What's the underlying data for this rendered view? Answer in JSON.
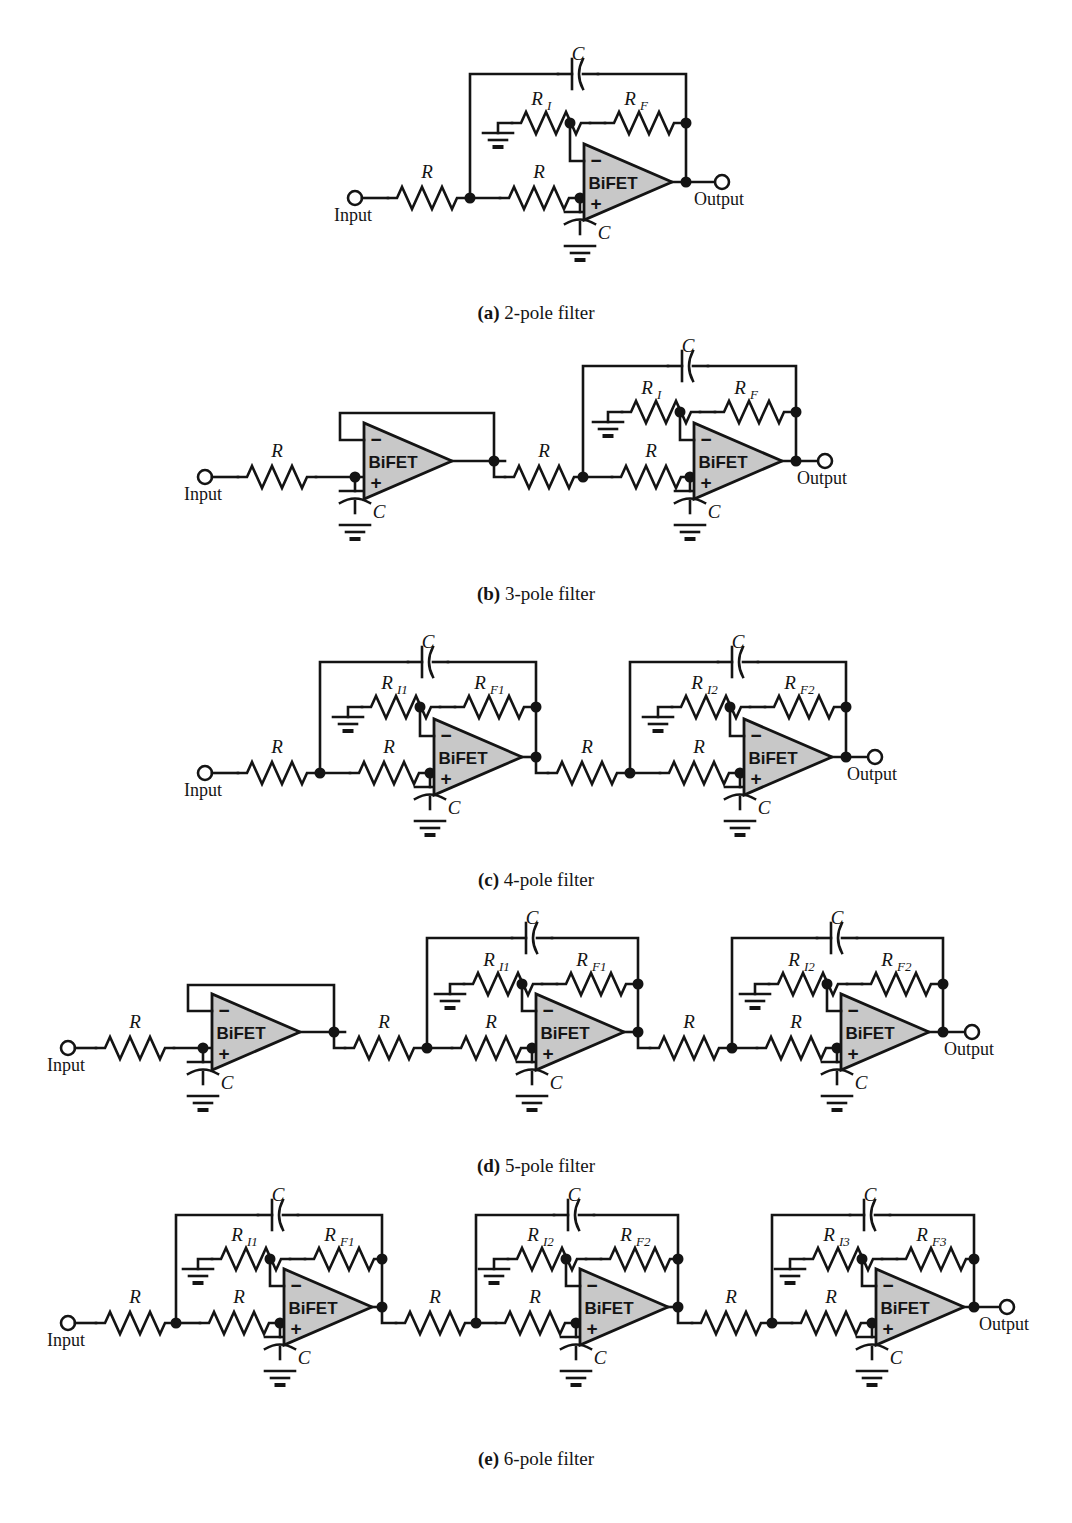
{
  "figure": {
    "title_hidden": "",
    "labels": {
      "input": "Input",
      "output": "Output",
      "amp": "BiFET",
      "minus": "−",
      "plus": "+",
      "R": "R",
      "C": "C",
      "RI": "R",
      "RI_sub": "I",
      "RF": "R",
      "RF_sub": "F",
      "RI1_sub": "I1",
      "RF1_sub": "F1",
      "RI2_sub": "I2",
      "RF2_sub": "F2",
      "RI3_sub": "I3",
      "RF3_sub": "F3"
    },
    "colors": {
      "wire": "#141414",
      "amp_fill": "#c8c8c8",
      "background": "#ffffff",
      "terminal_fill": "#ffffff"
    },
    "rows": [
      {
        "id": "a",
        "tag": "(a)",
        "caption": "2-pole filter",
        "poles": 2,
        "stages": [
          "sallen-key-2pole"
        ],
        "components": [
          "R",
          "R",
          "C",
          "C",
          "R_I",
          "R_F"
        ]
      },
      {
        "id": "b",
        "tag": "(b)",
        "caption": "3-pole filter",
        "poles": 3,
        "stages": [
          "single-pole-follower",
          "sallen-key-2pole"
        ],
        "components": [
          "R",
          "C",
          "R",
          "R",
          "C",
          "C",
          "R_I",
          "R_F"
        ]
      },
      {
        "id": "c",
        "tag": "(c)",
        "caption": "4-pole filter",
        "poles": 4,
        "stages": [
          "sallen-key-2pole",
          "sallen-key-2pole"
        ],
        "components": [
          "R",
          "R",
          "C",
          "C",
          "R_I1",
          "R_F1",
          "R",
          "R",
          "C",
          "C",
          "R_I2",
          "R_F2"
        ]
      },
      {
        "id": "d",
        "tag": "(d)",
        "caption": "5-pole filter",
        "poles": 5,
        "stages": [
          "single-pole-follower",
          "sallen-key-2pole",
          "sallen-key-2pole"
        ],
        "components": [
          "R",
          "C",
          "R",
          "R",
          "C",
          "C",
          "R_I1",
          "R_F1",
          "R",
          "R",
          "C",
          "C",
          "R_I2",
          "R_F2"
        ]
      },
      {
        "id": "e",
        "tag": "(e)",
        "caption": "6-pole filter",
        "poles": 6,
        "stages": [
          "sallen-key-2pole",
          "sallen-key-2pole",
          "sallen-key-2pole"
        ],
        "components": [
          "R",
          "R",
          "C",
          "C",
          "R_I1",
          "R_F1",
          "R",
          "R",
          "C",
          "C",
          "R_I2",
          "R_F2",
          "R",
          "R",
          "C",
          "C",
          "R_I3",
          "R_F3"
        ]
      }
    ]
  }
}
